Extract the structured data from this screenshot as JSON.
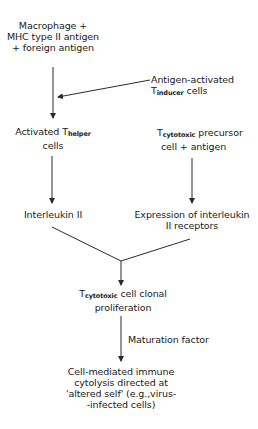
{
  "diagram": {
    "type": "flowchart",
    "title": "",
    "nodes": {
      "macrophage": {
        "lines": [
          "Macrophage +",
          "MHC type II antigen",
          "+ foreign antigen"
        ]
      },
      "inducer": {
        "line1": "Antigen-activated",
        "line2_main": "T",
        "line2_sub": "inducer",
        "line2_rest": " cells"
      },
      "helper": {
        "line1_main": "Activated T",
        "line1_sub": "helper",
        "line2": "cells"
      },
      "precursor": {
        "line1_main": "T",
        "line1_sub": "cytotoxic",
        "line1_rest": " precursor",
        "line2": "cell + antigen"
      },
      "interleukin": {
        "label": "Interleukin II"
      },
      "receptors": {
        "lines": [
          "Expression of interleukin",
          "II receptors"
        ]
      },
      "proliferation": {
        "line1_main": "T",
        "line1_sub": "cytotoxic",
        "line1_rest": " cell clonal",
        "line2": "proliferation"
      },
      "maturation": {
        "label": "Maturation factor"
      },
      "cytolysis": {
        "lines": [
          "Cell-mediated immune",
          "cytolysis directed at",
          "'altered self' (e.g.,virus-",
          "-infected cells)"
        ]
      }
    },
    "edges": [
      {
        "from": "macrophage",
        "to": "helper"
      },
      {
        "from": "inducer",
        "to": "helper"
      },
      {
        "from": "helper",
        "to": "interleukin"
      },
      {
        "from": "precursor",
        "to": "receptors"
      },
      {
        "from": "interleukin",
        "to": "proliferation"
      },
      {
        "from": "receptors",
        "to": "proliferation"
      },
      {
        "from": "proliferation",
        "to": "cytolysis",
        "label": "Maturation factor"
      }
    ],
    "colors": {
      "line": "#2a2a2a",
      "text": "#1a1a1a",
      "background": "#ffffff"
    }
  }
}
